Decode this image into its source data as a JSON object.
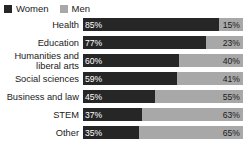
{
  "legend": {
    "items": [
      {
        "label": "Women",
        "color": "#262626",
        "swatch": "legend-swatch-women"
      },
      {
        "label": "Men",
        "color": "#a8a8a8",
        "swatch": "legend-swatch-men"
      }
    ]
  },
  "chart_data": {
    "type": "bar",
    "orientation": "horizontal",
    "stacked": true,
    "normalized_percent": true,
    "title": "",
    "subtitle": "",
    "xlabel": "",
    "ylabel": "",
    "xlim": [
      0,
      100
    ],
    "grid": false,
    "legend_position": "top-left",
    "categories": [
      "Health",
      "Education",
      "Humanities and\nliberal arts",
      "Social sciences",
      "Business and law",
      "STEM",
      "Other"
    ],
    "series": [
      {
        "name": "Women",
        "color": "#262626",
        "values": [
          85,
          77,
          60,
          59,
          45,
          37,
          35
        ],
        "labels": [
          "85%",
          "77%",
          "60%",
          "59%",
          "45%",
          "37%",
          "35%"
        ]
      },
      {
        "name": "Men",
        "color": "#a8a8a8",
        "values": [
          15,
          23,
          40,
          41,
          55,
          63,
          65
        ],
        "labels": [
          "15%",
          "23%",
          "40%",
          "41%",
          "55%",
          "63%",
          "65%"
        ]
      }
    ],
    "rows": [
      {
        "category": "Health",
        "women": 85,
        "men": 15,
        "women_label": "85%",
        "men_label": "15%"
      },
      {
        "category": "Education",
        "women": 77,
        "men": 23,
        "women_label": "77%",
        "men_label": "23%"
      },
      {
        "category": "Humanities and\nliberal arts",
        "women": 60,
        "men": 40,
        "women_label": "60%",
        "men_label": "40%"
      },
      {
        "category": "Social sciences",
        "women": 59,
        "men": 41,
        "women_label": "59%",
        "men_label": "41%"
      },
      {
        "category": "Business and law",
        "women": 45,
        "men": 55,
        "women_label": "45%",
        "men_label": "55%"
      },
      {
        "category": "STEM",
        "women": 37,
        "men": 63,
        "women_label": "37%",
        "men_label": "63%"
      },
      {
        "category": "Other",
        "women": 35,
        "men": 65,
        "women_label": "35%",
        "men_label": "65%"
      }
    ]
  }
}
